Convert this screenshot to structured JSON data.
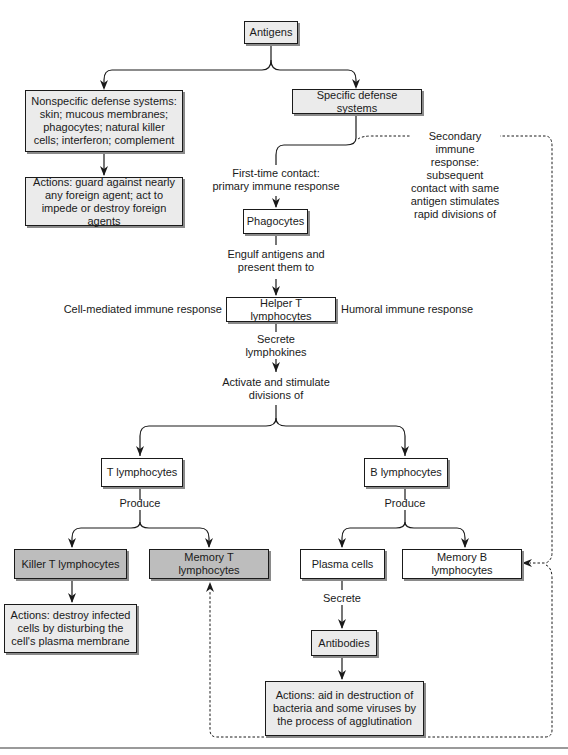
{
  "diagram": {
    "title": "Antigens",
    "nodes": {
      "antigens": "Antigens",
      "nonspecific": "Nonspecific defense systems: skin; mucous membranes; phagocytes; natural killer cells; interferon; complement",
      "nonspecific_actions": "Actions: guard against nearly any foreign agent; act to impede or destroy foreign agents",
      "specific": "Specific defense systems",
      "phagocytes": "Phagocytes",
      "helper_t": "Helper T lymphocytes",
      "t_lymphocytes": "T lymphocytes",
      "b_lymphocytes": "B lymphocytes",
      "killer_t": "Killer T lymphocytes",
      "memory_t": "Memory T lymphocytes",
      "plasma_cells": "Plasma cells",
      "memory_b": "Memory B lymphocytes",
      "killer_actions": "Actions: destroy infected cells by disturbing the cell's plasma membrane",
      "antibodies": "Antibodies",
      "antibody_actions": "Actions: aid in destruction of bacteria and some viruses by the process of agglutination"
    },
    "edge_labels": {
      "first_contact": "First-time contact:\nprimary immune response",
      "secondary": "Secondary immune\nresponse: subsequent\ncontact with same\nantigen stimulates\nrapid divisions of",
      "engulf": "Engulf antigens and\npresent them to",
      "cell_mediated": "Cell-mediated immune response",
      "humoral": "Humoral immune response",
      "secrete_lymphokines": "Secrete\nlymphokines",
      "activate": "Activate and stimulate\ndivisions of",
      "produce_t": "Produce",
      "produce_b": "Produce",
      "secrete": "Secrete"
    },
    "colors": {
      "light_box": "#ebebeb",
      "dark_box": "#bdbdbd",
      "white_box": "#ffffff",
      "line": "#1a1a1a"
    }
  }
}
